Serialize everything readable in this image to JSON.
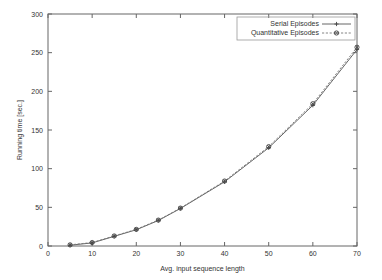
{
  "chart_data": {
    "type": "line",
    "title": "",
    "subtitle": "",
    "xlabel": "Avg. input sequence length",
    "ylabel": "Running time [sec.]",
    "xlim": [
      0,
      70
    ],
    "ylim": [
      0,
      300
    ],
    "xticks": [
      0,
      10,
      20,
      30,
      40,
      50,
      60,
      70
    ],
    "yticks": [
      0,
      50,
      100,
      150,
      200,
      250,
      300
    ],
    "xtick_labels": [
      "0",
      "10",
      "20",
      "30",
      "40",
      "50",
      "60",
      "70"
    ],
    "ytick_labels": [
      "0",
      "50",
      "100",
      "150",
      "200",
      "250",
      "300"
    ],
    "grid": false,
    "legend_position": "top-right",
    "x": [
      5,
      10,
      15,
      20,
      25,
      30,
      40,
      50,
      60,
      70
    ],
    "series": [
      {
        "name": "Serial Episodes",
        "marker": "plus",
        "linestyle": "solid",
        "color": "#555555",
        "values": [
          1,
          4,
          12.5,
          21,
          33,
          48.5,
          83,
          127,
          182,
          254
        ]
      },
      {
        "name": "Quantitative Episodes",
        "marker": "circle-x",
        "linestyle": "dotted",
        "color": "#777777",
        "values": [
          1.5,
          4.5,
          13,
          21.5,
          33.5,
          49,
          84,
          128.5,
          184,
          257
        ]
      }
    ],
    "annotations": []
  },
  "legend": {
    "entries": [
      {
        "label": "Serial Episodes"
      },
      {
        "label": "Quantitative Episodes"
      }
    ]
  },
  "colors": {
    "axis": "#666666",
    "text": "#333333",
    "series_0": "#555555",
    "series_1": "#777777",
    "background": "#ffffff"
  }
}
